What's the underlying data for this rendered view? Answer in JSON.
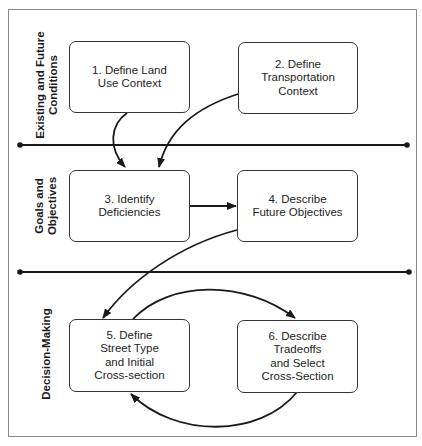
{
  "diagram": {
    "type": "process-flow-swimlane",
    "sections": [
      {
        "id": "existing",
        "label": "Existing and Future\nConditions"
      },
      {
        "id": "goals",
        "label": "Goals and\nObjectives"
      },
      {
        "id": "decision",
        "label": "Decision-Making"
      }
    ],
    "steps": [
      {
        "id": 1,
        "label": "1. Define Land\nUse Context",
        "section": "existing"
      },
      {
        "id": 2,
        "label": "2. Define\nTransportation\nContext",
        "section": "existing"
      },
      {
        "id": 3,
        "label": "3. Identify\nDeficiencies",
        "section": "goals"
      },
      {
        "id": 4,
        "label": "4. Describe\nFuture Objectives",
        "section": "goals"
      },
      {
        "id": 5,
        "label": "5. Define\nStreet Type\nand Initial\nCross-section",
        "section": "decision"
      },
      {
        "id": 6,
        "label": "6. Describe\nTradeoffs\nand Select\nCross-Section",
        "section": "decision"
      }
    ],
    "edges": [
      {
        "from": 1,
        "to": 3
      },
      {
        "from": 2,
        "to": 3
      },
      {
        "from": 3,
        "to": 4
      },
      {
        "from": 4,
        "to": 5
      },
      {
        "from": 5,
        "to": 6
      },
      {
        "from": 6,
        "to": 5
      }
    ],
    "colors": {
      "stroke": "#1a1a1a",
      "frame": "#8a8a8a",
      "background": "#ffffff"
    }
  }
}
